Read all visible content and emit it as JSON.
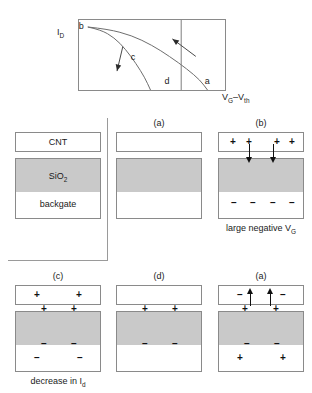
{
  "chart_data": {
    "type": "line",
    "title": "",
    "xlabel": "V_G-V_th",
    "ylabel": "I_D",
    "xlabel_parts": {
      "v": "V",
      "g": "G",
      "dash": "–",
      "v2": "V",
      "th": "th"
    },
    "ylabel_parts": {
      "i": "I",
      "d": "D"
    },
    "grid": false,
    "legend": "none",
    "axis_box": true,
    "point_labels": [
      {
        "id": "b",
        "label": "b",
        "x_frac": 0.04,
        "y_frac": 0.07
      },
      {
        "id": "c",
        "label": "c",
        "x_frac": 0.34,
        "y_frac": 0.53
      },
      {
        "id": "d",
        "label": "d",
        "x_frac": 0.6,
        "y_frac": 0.9
      },
      {
        "id": "a",
        "label": "a",
        "x_frac": 0.84,
        "y_frac": 0.9
      }
    ],
    "series": [
      {
        "name": "outer-sweep-to-a",
        "comment": "upper/outer decaying curve from b falling to a",
        "points": [
          [
            0.06,
            0.1
          ],
          [
            0.2,
            0.13
          ],
          [
            0.36,
            0.22
          ],
          [
            0.5,
            0.36
          ],
          [
            0.62,
            0.52
          ],
          [
            0.74,
            0.7
          ],
          [
            0.83,
            0.86
          ],
          [
            0.88,
            1.0
          ]
        ]
      },
      {
        "name": "inner-sweep-to-d",
        "comment": "lower/inner decaying curve from b falling near d",
        "points": [
          [
            0.06,
            0.1
          ],
          [
            0.15,
            0.14
          ],
          [
            0.24,
            0.25
          ],
          [
            0.32,
            0.42
          ],
          [
            0.39,
            0.62
          ],
          [
            0.45,
            0.82
          ],
          [
            0.49,
            1.0
          ]
        ]
      }
    ],
    "vertical_line_x_frac": 0.7,
    "arrows": [
      {
        "name": "arrow-upper-right",
        "comment": "points up-left toward outer curve",
        "x1_frac": 0.8,
        "y1_frac": 0.52,
        "x2_frac": 0.64,
        "y2_frac": 0.27
      },
      {
        "name": "arrow-lower-left",
        "comment": "points down toward inner curve near c",
        "x1_frac": 0.3,
        "y1_frac": 0.38,
        "x2_frac": 0.26,
        "y2_frac": 0.73
      }
    ]
  },
  "legend_panel": {
    "name": "layer-stack-legend",
    "layers": [
      {
        "id": "cnt",
        "label": "CNT"
      },
      {
        "id": "sio2",
        "label_main": "SiO",
        "label_sub": "2"
      },
      {
        "id": "backgate",
        "label": "backgate"
      }
    ]
  },
  "panels": [
    {
      "id": "panel-a-top",
      "title": "(a)",
      "caption": "",
      "charges": []
    },
    {
      "id": "panel-b-top",
      "title": "(b)",
      "caption": "large negative V",
      "caption_sub": "G",
      "charges": [
        {
          "zone": "cnt",
          "sym": "+",
          "x": 12,
          "y": 5
        },
        {
          "zone": "cnt",
          "sym": "+",
          "x": 28,
          "y": 5
        },
        {
          "zone": "cnt",
          "sym": "+",
          "x": 56,
          "y": 5
        },
        {
          "zone": "cnt",
          "sym": "+",
          "x": 71,
          "y": 5
        },
        {
          "zone": "backgate",
          "sym": "–",
          "x": 13,
          "y": 66
        },
        {
          "zone": "backgate",
          "sym": "–",
          "x": 32,
          "y": 66
        },
        {
          "zone": "backgate",
          "sym": "–",
          "x": 52,
          "y": 66
        },
        {
          "zone": "backgate",
          "sym": "–",
          "x": 71,
          "y": 66
        }
      ],
      "arrows": [
        {
          "dir": "down",
          "x": 31,
          "y": 12,
          "len": 14
        },
        {
          "dir": "down",
          "x": 55,
          "y": 12,
          "len": 14
        }
      ]
    },
    {
      "id": "panel-c-bottom",
      "title": "(c)",
      "caption": "decrease in I",
      "caption_sub": "d",
      "charges": [
        {
          "zone": "cnt",
          "sym": "+",
          "x": 19,
          "y": 5
        },
        {
          "zone": "cnt",
          "sym": "+",
          "x": 61,
          "y": 5
        },
        {
          "zone": "ox-top",
          "sym": "+",
          "x": 26,
          "y": 19
        },
        {
          "zone": "ox-top",
          "sym": "+",
          "x": 56,
          "y": 19
        },
        {
          "zone": "ox-bot",
          "sym": "–",
          "x": 26,
          "y": 54
        },
        {
          "zone": "ox-bot",
          "sym": "–",
          "x": 56,
          "y": 54
        },
        {
          "zone": "backgate",
          "sym": "–",
          "x": 19,
          "y": 68
        },
        {
          "zone": "backgate",
          "sym": "–",
          "x": 62,
          "y": 68
        }
      ],
      "arrows": []
    },
    {
      "id": "panel-d-bottom",
      "title": "(d)",
      "caption": "",
      "charges": [
        {
          "zone": "ox-top",
          "sym": "+",
          "x": 26,
          "y": 19
        },
        {
          "zone": "ox-top",
          "sym": "+",
          "x": 56,
          "y": 19
        },
        {
          "zone": "ox-bot",
          "sym": "–",
          "x": 26,
          "y": 54
        },
        {
          "zone": "ox-bot",
          "sym": "–",
          "x": 56,
          "y": 54
        }
      ],
      "arrows": []
    },
    {
      "id": "panel-a-bottom",
      "title": "(a)",
      "caption": "",
      "charges": [
        {
          "zone": "cnt",
          "sym": "–",
          "x": 19,
          "y": 5
        },
        {
          "zone": "cnt",
          "sym": "–",
          "x": 62,
          "y": 5
        },
        {
          "zone": "ox-top",
          "sym": "+",
          "x": 24,
          "y": 19
        },
        {
          "zone": "ox-top",
          "sym": "+",
          "x": 55,
          "y": 19
        },
        {
          "zone": "ox-bot",
          "sym": "–",
          "x": 26,
          "y": 54
        },
        {
          "zone": "ox-bot",
          "sym": "–",
          "x": 56,
          "y": 54
        },
        {
          "zone": "backgate",
          "sym": "+",
          "x": 19,
          "y": 68
        },
        {
          "zone": "backgate",
          "sym": "+",
          "x": 62,
          "y": 68
        }
      ],
      "arrows": [
        {
          "dir": "up",
          "x": 32,
          "y": 8,
          "len": 13
        },
        {
          "dir": "up",
          "x": 52,
          "y": 8,
          "len": 13
        }
      ]
    }
  ],
  "colors": {
    "oxide_fill": "#c9c9c9",
    "line": "#8a8a8a",
    "ink": "#1a1a1a",
    "curve": "#6e6e6e"
  }
}
